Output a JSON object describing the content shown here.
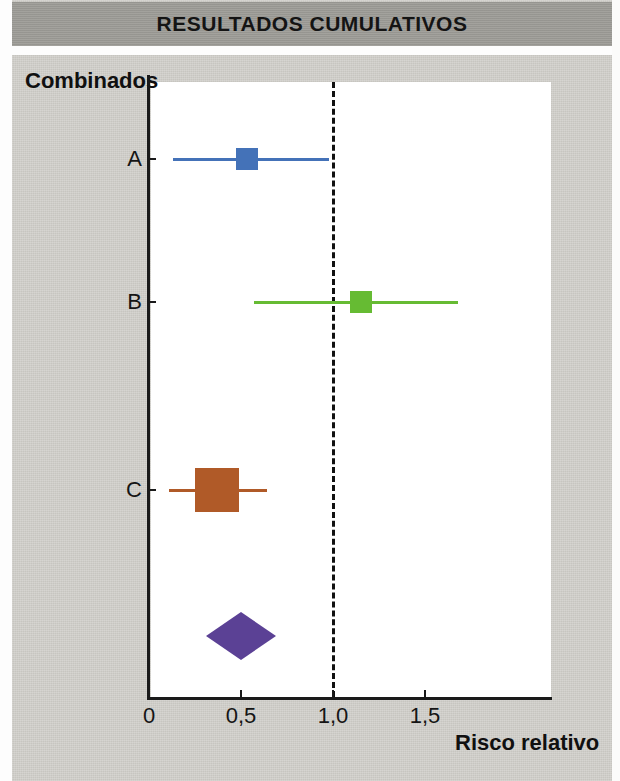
{
  "header": {
    "title": "RESULTADOS CUMULATIVOS",
    "band_color": "#9b9a95"
  },
  "labels": {
    "group_label": "Combinados",
    "axis_title": "Risco relativo"
  },
  "chart_data": {
    "type": "forest",
    "title": "RESULTADOS CUMULATIVOS",
    "xlabel": "Risco relativo",
    "ylabel": "Combinados",
    "xlim": [
      0,
      1.8
    ],
    "xticks": [
      0,
      0.5,
      1.0,
      1.5
    ],
    "xtick_labels": [
      "0",
      "0,5",
      "1,0",
      "1,5"
    ],
    "grid": false,
    "legend": "none",
    "reference_line": {
      "value": 1.0,
      "style": "dashed",
      "color": "#111111"
    },
    "studies": [
      {
        "label": "A",
        "estimate": 0.53,
        "ci_low": 0.13,
        "ci_high": 0.98,
        "color": "#4472b8",
        "marker": "square",
        "marker_size_px": 22
      },
      {
        "label": "B",
        "estimate": 1.15,
        "ci_low": 0.57,
        "ci_high": 1.68,
        "color": "#66bb33",
        "marker": "square",
        "marker_size_px": 22
      },
      {
        "label": "C",
        "estimate": 0.37,
        "ci_low": 0.11,
        "ci_high": 0.64,
        "color": "#b05a28",
        "marker": "square",
        "marker_size_px": 44
      }
    ],
    "summary": {
      "label": "",
      "estimate": 0.5,
      "ci_low": 0.31,
      "ci_high": 0.69,
      "color": "#5b4195",
      "marker": "diamond",
      "width_px": 70,
      "height_px": 48
    }
  }
}
